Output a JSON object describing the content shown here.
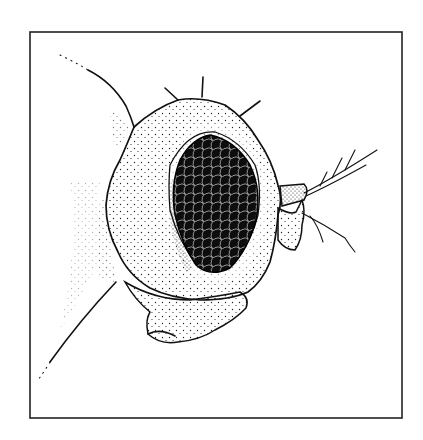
{
  "figure": {
    "elements": [
      "frame",
      "body-outline",
      "head-capsule",
      "compound-eye",
      "bristles",
      "antenna-arista",
      "mouthparts"
    ],
    "colors": {
      "ink": "#111111",
      "background": "#ffffff",
      "frame": "#222222"
    },
    "frame": {
      "x": 30,
      "y": 32,
      "width": 372,
      "height": 386
    }
  }
}
